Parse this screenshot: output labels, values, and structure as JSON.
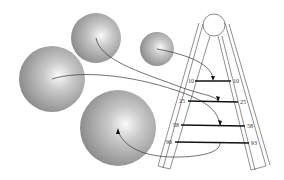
{
  "diagram": {
    "title": "",
    "spheres": [
      {
        "id": "sphere-top-left",
        "cx": 96,
        "cy": 38,
        "r": 25
      },
      {
        "id": "sphere-small-top",
        "cx": 157,
        "cy": 49,
        "r": 17
      },
      {
        "id": "sphere-large-left",
        "cx": 52,
        "cy": 79,
        "r": 33
      },
      {
        "id": "sphere-bottom",
        "cx": 118,
        "cy": 128,
        "r": 38
      }
    ],
    "ladder": {
      "rung_labels_left": [
        "10",
        "25",
        "58",
        "90"
      ],
      "rung_labels_right": [
        "10",
        "25",
        "58",
        "93"
      ]
    },
    "colors": {
      "sphere_dark": "#8a8a8a",
      "sphere_light": "#f2f2f2",
      "line": "#333333",
      "rung": "#111111"
    }
  }
}
